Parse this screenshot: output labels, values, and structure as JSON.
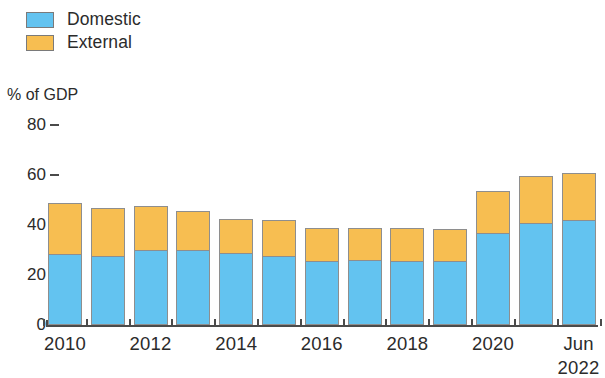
{
  "legend": {
    "items": [
      {
        "label": "Domestic",
        "color": "#63C3F0",
        "key": "domestic"
      },
      {
        "label": "External",
        "color": "#F7BE51",
        "key": "external"
      }
    ]
  },
  "axis_title": "% of GDP",
  "chart_data": {
    "type": "bar",
    "subtype": "stacked-vertical",
    "title": "",
    "subtitle": "",
    "xlabel": "",
    "ylabel": "% of GDP",
    "ylim": [
      0,
      80
    ],
    "yticks": [
      0,
      20,
      40,
      60,
      80
    ],
    "grid": false,
    "legend_position": "top-left",
    "categories": [
      "2010",
      "2011",
      "2012",
      "2013",
      "2014",
      "2015",
      "2016",
      "2017",
      "2018",
      "2019",
      "2020",
      "2021",
      "Jun 2022"
    ],
    "tick_labels": [
      "2010",
      "",
      "2012",
      "",
      "2014",
      "",
      "2016",
      "",
      "2018",
      "",
      "2020",
      "",
      "Jun\n2022"
    ],
    "series": [
      {
        "name": "Domestic",
        "color": "#63C3F0",
        "values": [
          28.5,
          27.5,
          30.0,
          30.0,
          29.0,
          27.5,
          25.5,
          26.0,
          25.5,
          25.5,
          37.0,
          41.0,
          42.0
        ]
      },
      {
        "name": "External",
        "color": "#F7BE51",
        "values": [
          20.5,
          19.5,
          17.5,
          15.5,
          13.5,
          14.5,
          13.5,
          13.0,
          13.5,
          13.0,
          16.5,
          18.5,
          19.0
        ]
      }
    ],
    "totals": [
      49.0,
      47.0,
      47.5,
      45.5,
      42.5,
      42.0,
      39.0,
      39.0,
      39.0,
      38.5,
      53.5,
      59.5,
      61.0
    ]
  }
}
